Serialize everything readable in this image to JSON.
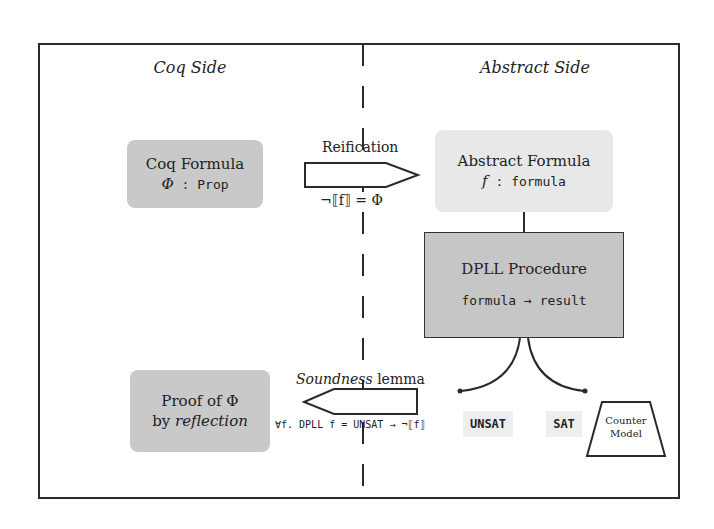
{
  "title_left": "Coq Side",
  "title_right": "Abstract Side",
  "coq_formula": {
    "line1": "Coq Formula",
    "symbol": "Φ",
    "sep": " : ",
    "type": "Prop"
  },
  "abstract_formula": {
    "line1": "Abstract Formula",
    "symbol": "f",
    "sep": " : ",
    "type": "formula"
  },
  "reification": {
    "label": "Reification",
    "equation": "¬⟦f⟧ = Φ"
  },
  "dpll": {
    "title": "DPLL Procedure",
    "signature": "formula → result"
  },
  "soundness": {
    "label_italic": "Soundness",
    "label_rest": " lemma",
    "statement": "∀f. DPLL f = UNSAT → ¬⟦f⟧"
  },
  "proof": {
    "line1": "Proof of Φ",
    "line2_prefix": "by ",
    "line2_italic": "reflection"
  },
  "results": {
    "unsat": "UNSAT",
    "sat": "SAT"
  },
  "counter_model": {
    "line1": "Counter",
    "line2": "Model"
  },
  "colors": {
    "dark_box": "#c9c9c9",
    "light_box": "#e8e8e8",
    "stroke": "#2a2a2a"
  }
}
